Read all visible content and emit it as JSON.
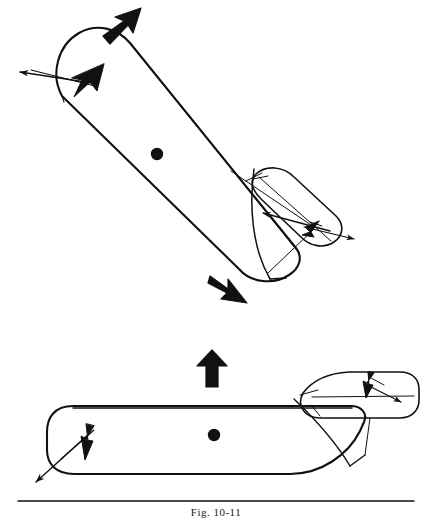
{
  "figure": {
    "caption": "Fig. 10-11",
    "background_color": "#ffffff",
    "ink_color": "#111111",
    "rule": {
      "present": true,
      "x1": 18,
      "x2": 414,
      "y": 501,
      "thickness": 1.4
    },
    "panels": [
      {
        "name": "upper-panel",
        "description": "Ship rotated diagonally (bow upper-left, stern lower-right) with tug pushing at stern quarter",
        "ship": {
          "name": "ship-hull-upper",
          "orientation_deg": 42,
          "center_of_gravity": {
            "x": 157,
            "y": 154,
            "r": 6.2
          },
          "hull_path": "M 63 93 C 52 72 60 45 80 34 C 98 24 118 30 131 45 L 292 245 C 300 256 296 268 285 276 C 270 287 248 285 236 272 Z"
        },
        "tug": {
          "name": "tug-hull-upper",
          "description": "Small tug at ship stern quarter, angled, pushing",
          "hull_path": "M 258 170 C 272 164 288 168 300 180 L 335 215 C 343 224 341 236 332 242 C 322 249 308 247 300 239 L 262 200 C 254 192 252 178 258 170 Z"
        },
        "arrows": [
          {
            "name": "bold-arrow-ship-motion",
            "style": "bold-solid",
            "semantic": "resultant-ship-motion",
            "from": {
              "x": 104,
              "y": 33
            },
            "to": {
              "x": 137,
              "y": 7
            }
          },
          {
            "name": "bold-arrow-stern-swing",
            "style": "bold-solid",
            "semantic": "stern-swing-direction",
            "from": {
              "x": 211,
              "y": 276
            },
            "to": {
              "x": 244,
              "y": 303
            }
          },
          {
            "name": "thin-arrow-bow-thruster",
            "style": "thin-line",
            "semantic": "bow-thruster-force",
            "from": {
              "x": 92,
              "y": 83
            },
            "to": {
              "x": 17,
              "y": 72
            }
          },
          {
            "name": "thin-arrow-bow-resultant",
            "style": "thin-line",
            "semantic": "bow-resultant-force",
            "from": {
              "x": 29,
              "y": 70
            },
            "to": {
              "x": 101,
              "y": 88
            }
          },
          {
            "name": "thin-arrow-tug-push",
            "style": "thin-line",
            "semantic": "tug-push-force-on-stern",
            "from": {
              "x": 330,
              "y": 231
            },
            "to": {
              "x": 260,
              "y": 212
            }
          },
          {
            "name": "thin-arrow-tug-reaction",
            "style": "thin-line",
            "semantic": "tug-reaction-force",
            "from": {
              "x": 302,
              "y": 226
            },
            "to": {
              "x": 357,
              "y": 240
            }
          }
        ],
        "bold_vector_heads": [
          {
            "name": "bold-head-bow-upper",
            "x": 88,
            "y": 84,
            "angle_deg": 28
          },
          {
            "name": "bold-head-stern-upper",
            "x": 312,
            "y": 228,
            "angle_deg": 200
          }
        ]
      },
      {
        "name": "lower-panel",
        "description": "Ship in plan view, horizontal, bow left and stern right, with tug at stern",
        "ship": {
          "name": "ship-hull-lower",
          "orientation_deg": 0,
          "center_of_gravity": {
            "x": 214,
            "y": 435,
            "r": 6.2
          },
          "hull_path": "M 74 406 C 55 406 48 418 48 432 L 48 450 C 48 463 56 474 74 474 L 290 474 C 320 474 346 456 358 432 L 362 423 C 366 414 360 406 350 406 Z"
        },
        "tug": {
          "name": "tug-hull-lower",
          "description": "Small tug at ship stern on upper right, pushing",
          "hull_path": "M 300 395 C 310 381 326 374 346 373 L 400 373 C 412 373 419 380 419 390 L 419 400 C 419 411 411 418 400 418 L 318 418 C 304 418 296 408 300 395 Z"
        },
        "arrows": [
          {
            "name": "bold-arrow-ship-motion-lower",
            "style": "bold-solid",
            "semantic": "resultant-ship-motion",
            "from": {
              "x": 212,
              "y": 387
            },
            "to": {
              "x": 212,
              "y": 353
            }
          },
          {
            "name": "thin-arrow-bow-thruster-lower",
            "style": "thin-line",
            "semantic": "bow-thruster-force",
            "from": {
              "x": 90,
              "y": 432
            },
            "to": {
              "x": 33,
              "y": 484
            }
          },
          {
            "name": "thin-arrow-bow-resultant-lower",
            "style": "thin-line",
            "semantic": "bow-resultant-force",
            "from": {
              "x": 59,
              "y": 460
            },
            "to": {
              "x": 92,
              "y": 430
            }
          },
          {
            "name": "thin-arrow-tug-reaction-lower",
            "style": "thin-line",
            "semantic": "tug-reaction-force",
            "from": {
              "x": 366,
              "y": 384
            },
            "to": {
              "x": 404,
              "y": 404
            }
          }
        ],
        "bold_vector_heads": [
          {
            "name": "bold-head-bow-lower",
            "x": 87,
            "y": 432,
            "angle_deg": 270
          },
          {
            "name": "bold-head-stern-lower",
            "x": 369,
            "y": 383,
            "angle_deg": 272
          }
        ]
      }
    ]
  }
}
